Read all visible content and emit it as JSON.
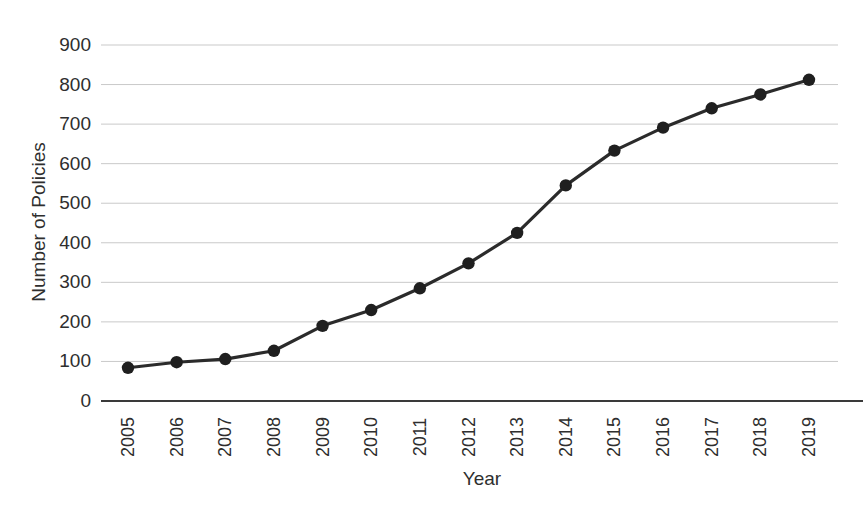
{
  "chart_data": {
    "type": "line",
    "title": "",
    "xlabel": "Year",
    "ylabel": "Number of Policies",
    "categories": [
      "2005",
      "2006",
      "2007",
      "2008",
      "2009",
      "2010",
      "2011",
      "2012",
      "2013",
      "2014",
      "2015",
      "2016",
      "2017",
      "2018",
      "2019"
    ],
    "values": [
      84,
      98,
      106,
      127,
      190,
      230,
      285,
      348,
      425,
      545,
      633,
      691,
      740,
      775,
      812
    ],
    "x": [
      2005,
      2006,
      2007,
      2008,
      2009,
      2010,
      2011,
      2012,
      2013,
      2014,
      2015,
      2016,
      2017,
      2018,
      2019
    ],
    "ylim": [
      0,
      900
    ],
    "yticks": [
      0,
      100,
      200,
      300,
      400,
      500,
      600,
      700,
      800,
      900
    ],
    "ytick_labels": [
      "0",
      "100",
      "200",
      "300",
      "400",
      "500",
      "600",
      "700",
      "800",
      "900"
    ],
    "grid": "horizontal",
    "legend": "none",
    "series": [
      {
        "name": "Number of Policies",
        "values": [
          84,
          98,
          106,
          127,
          190,
          230,
          285,
          348,
          425,
          545,
          633,
          691,
          740,
          775,
          812
        ],
        "line_color": "#2b2b2b",
        "marker": "circle",
        "marker_color": "#1f1f1f"
      }
    ],
    "colors": {
      "line": "#2b2b2b",
      "marker": "#1f1f1f",
      "grid": "#c9c9c9",
      "axis": "#3a3a3a",
      "text": "#2e2e2e",
      "background": "#ffffff"
    }
  }
}
